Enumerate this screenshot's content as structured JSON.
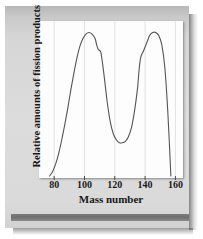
{
  "figure": {
    "kind": "scientific-figure",
    "background_color": "#d9d9d9",
    "plot_background_color": "#fdfdfd"
  },
  "chart_data": {
    "type": "line",
    "title": "",
    "subtitle": "",
    "xlabel": "Mass number",
    "ylabel": "Relative amounts of fission products",
    "xlim": [
      70,
      165
    ],
    "ylim": [
      0,
      100
    ],
    "grid": true,
    "grid_axis": "x",
    "legend": false,
    "legend_position": "none",
    "xticks": [
      80,
      100,
      120,
      140,
      160
    ],
    "xtick_labels": [
      "80",
      "100",
      "120",
      "140",
      "160"
    ],
    "yticks": [],
    "ytick_labels": [],
    "line_color": "#555555",
    "annotations": [],
    "series": [
      {
        "name": "Fission product yield",
        "x": [
          77,
          79,
          81,
          83,
          85,
          87,
          89,
          91,
          93,
          95,
          97,
          99,
          101,
          103,
          105,
          107,
          108,
          109,
          110,
          111,
          113,
          115,
          117,
          119,
          121,
          123,
          125,
          127,
          129,
          131,
          133,
          135,
          136,
          137,
          138,
          139,
          141,
          143,
          145,
          147,
          149,
          151,
          153,
          155,
          157
        ],
        "y": [
          0,
          3,
          8,
          15,
          24,
          34,
          45,
          57,
          68,
          78,
          86,
          91,
          94,
          95,
          94,
          91,
          87,
          84,
          83,
          81,
          66,
          49,
          36,
          28,
          24,
          22,
          22,
          23,
          26,
          32,
          43,
          58,
          70,
          78,
          81,
          83,
          88,
          93,
          95,
          95,
          93,
          87,
          72,
          42,
          0
        ]
      }
    ]
  },
  "axis": {
    "x_title": "Mass number",
    "y_title": "Relative amounts of fission products",
    "tick_labels": [
      "80",
      "100",
      "120",
      "140",
      "160"
    ]
  }
}
